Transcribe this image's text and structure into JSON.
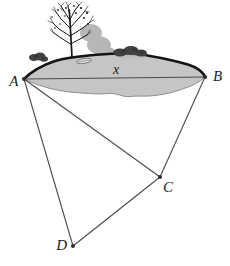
{
  "page": {
    "background": "#ffffff"
  },
  "colors": {
    "background": "#ffffff",
    "pond_fill": "#c5c5c5",
    "pond_top_edge": "#141414",
    "pond_bottom_edge": "#8f8f8f",
    "survey_line": "#4a4a4a",
    "vertex_dot": "#2e2e2e",
    "label_text": "#1c1c1c",
    "tree": "#181818",
    "tree_shadow": "#b7b7b7",
    "bush": "#404040",
    "bush_dark": "#2d2d2d",
    "boat_fill": "#e2e2e2",
    "boat_outline": "#676767"
  },
  "diagram": {
    "kind": "distance-across-pond-survey",
    "points": [
      {
        "id": "A",
        "label": "A",
        "x": 24,
        "y": 79,
        "lx": 18.5,
        "ly": 86,
        "anchor": "end"
      },
      {
        "id": "B",
        "label": "B",
        "x": 205,
        "y": 77,
        "lx": 213,
        "ly": 81,
        "anchor": "start"
      },
      {
        "id": "C",
        "label": "C",
        "x": 160,
        "y": 177,
        "lx": 163,
        "ly": 191.5,
        "anchor": "start"
      },
      {
        "id": "D",
        "label": "D",
        "x": 73,
        "y": 246,
        "lx": 67,
        "ly": 249.5,
        "anchor": "end"
      }
    ],
    "segments": [
      {
        "from": "A",
        "to": "B",
        "label": "x"
      },
      {
        "from": "A",
        "to": "C",
        "label": ""
      },
      {
        "from": "B",
        "to": "C",
        "label": ""
      },
      {
        "from": "A",
        "to": "D",
        "label": ""
      },
      {
        "from": "D",
        "to": "C",
        "label": ""
      }
    ],
    "segment_label": {
      "text": "x",
      "x": 116,
      "y": 74
    }
  },
  "scenery": {
    "items": [
      "pond",
      "bare-tree",
      "tree-shadow",
      "bush-left",
      "bushes-top",
      "rowboat"
    ]
  }
}
